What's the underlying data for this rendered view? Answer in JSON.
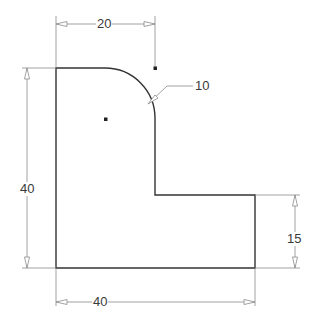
{
  "drawing": {
    "title": "L-shaped part with fillet",
    "colors": {
      "outline": "#333333",
      "dimension": "#8a8a8a",
      "text": "#3a3a3a"
    },
    "dimensions": {
      "top_width": "20",
      "fillet_radius": "10",
      "left_height": "40",
      "right_height": "15",
      "bottom_width": "40"
    }
  }
}
